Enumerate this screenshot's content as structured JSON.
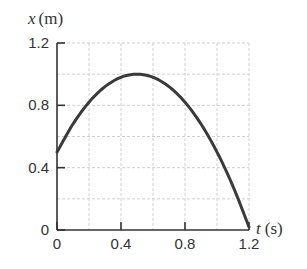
{
  "chart_data": {
    "type": "line",
    "title": "",
    "xlabel": "t (s)",
    "ylabel": "x (m)",
    "xlabel_var": "t",
    "xlabel_unit": "(s)",
    "ylabel_var": "x",
    "ylabel_unit": "(m)",
    "xlim": [
      0,
      1.2
    ],
    "ylim": [
      0,
      1.2
    ],
    "x_ticks": [
      "0",
      "0.4",
      "0.8",
      "1.2"
    ],
    "y_ticks": [
      "0",
      "0.4",
      "0.8",
      "1.2"
    ],
    "grid": true,
    "grid_step": 0.2,
    "legend": null,
    "series": [
      {
        "name": "x(t)",
        "x": [
          0,
          0.1,
          0.2,
          0.3,
          0.4,
          0.5,
          0.6,
          0.7,
          0.8,
          0.9,
          1.0,
          1.1,
          1.2
        ],
        "values": [
          0.5,
          0.68,
          0.82,
          0.92,
          0.98,
          1.0,
          0.98,
          0.92,
          0.82,
          0.68,
          0.5,
          0.28,
          0.02
        ]
      }
    ],
    "colors": {
      "curve": "#3a3a3a",
      "axis": "#333333",
      "grid": "#cfcfcf"
    }
  }
}
